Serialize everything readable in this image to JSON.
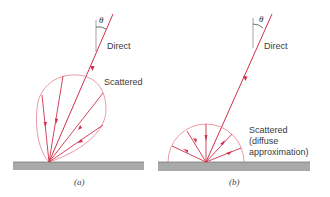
{
  "figure": {
    "panel_a": {
      "caption": "(a)",
      "angle_label": "θ",
      "direct_label": "Direct",
      "scattered_label": "Scattered"
    },
    "panel_b": {
      "caption": "(b)",
      "angle_label": "θ",
      "direct_label": "Direct",
      "scattered_label_line1": "Scattered",
      "scattered_label_line2": "(diffuse",
      "scattered_label_line3": "approximation)"
    },
    "colors": {
      "ray": "#d0304a",
      "envelope": "#e07080",
      "surface": "#a9a9a9",
      "surface_top": "#7a7a7a"
    }
  }
}
